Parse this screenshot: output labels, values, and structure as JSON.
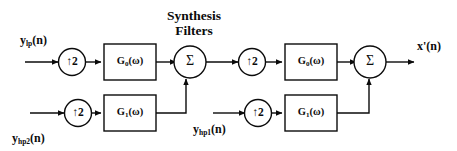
{
  "diagram": {
    "title_line1": "Synthesis",
    "title_line2": "Filters",
    "inputs": [
      {
        "id": "y-lp",
        "label_main": "y",
        "label_sub": "lp",
        "label_tail": "(n)"
      },
      {
        "id": "y-hp2",
        "label_main": "y",
        "label_sub": "hp2",
        "label_tail": "(n)"
      },
      {
        "id": "y-hp1",
        "label_main": "y",
        "label_sub": "hp1",
        "label_tail": "(n)"
      }
    ],
    "output": {
      "id": "x-prime",
      "label": "x'(n)"
    },
    "upsamplers": [
      {
        "id": "upsampler-stage1-lowpass",
        "label": "↑2"
      },
      {
        "id": "upsampler-stage1-highpass",
        "label": "↑2"
      },
      {
        "id": "upsampler-stage2-lowpass",
        "label": "↑2"
      },
      {
        "id": "upsampler-stage2-highpass",
        "label": "↑2"
      }
    ],
    "filters": [
      {
        "id": "filter-g0-stage1",
        "name": "G",
        "sub": "0",
        "arg": "(ω)"
      },
      {
        "id": "filter-g1-stage1",
        "name": "G",
        "sub": "1",
        "arg": "(ω)"
      },
      {
        "id": "filter-g0-stage2",
        "name": "G",
        "sub": "0",
        "arg": "(ω)"
      },
      {
        "id": "filter-g1-stage2",
        "name": "G",
        "sub": "1",
        "arg": "(ω)"
      }
    ],
    "adders": [
      {
        "id": "adder-stage1",
        "label": "Σ"
      },
      {
        "id": "adder-stage2",
        "label": "Σ"
      }
    ],
    "colors": {
      "stroke": "#0b0b0b",
      "background": "#ffffff",
      "text": "#0b0b0b"
    }
  }
}
